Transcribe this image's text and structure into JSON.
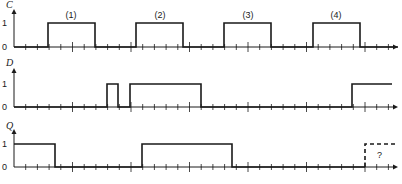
{
  "colors": {
    "ink": "#1a1a1a",
    "background": "#ffffff"
  },
  "axis": {
    "x_start": 14,
    "x_end": 398,
    "minor_tick_spacing": 11.7,
    "major_every": 5
  },
  "signals": [
    {
      "name": "C",
      "baseline_y": 47,
      "high_y": 23,
      "axis_top_y": 9,
      "label_y": 9,
      "level1_label": "1",
      "level0_label": "0",
      "edges": [
        [
          14,
          0
        ],
        [
          48,
          1
        ],
        [
          95,
          0
        ],
        [
          136,
          1
        ],
        [
          183,
          0
        ],
        [
          224,
          1
        ],
        [
          271,
          0
        ],
        [
          313,
          1
        ],
        [
          360,
          0
        ],
        [
          398,
          0
        ]
      ],
      "pulse_labels": [
        {
          "text": "(1)",
          "x": 71
        },
        {
          "text": "(2)",
          "x": 160
        },
        {
          "text": "(3)",
          "x": 248
        },
        {
          "text": "(4)",
          "x": 336
        }
      ]
    },
    {
      "name": "D",
      "baseline_y": 107,
      "high_y": 84,
      "axis_top_y": 68,
      "label_y": 67,
      "level1_label": "1",
      "level0_label": "0",
      "edges": [
        [
          14,
          0
        ],
        [
          107,
          1
        ],
        [
          118,
          0
        ],
        [
          130,
          1
        ],
        [
          201,
          0
        ],
        [
          352,
          1
        ],
        [
          392,
          1
        ]
      ],
      "pulse_labels": []
    },
    {
      "name": "Q",
      "baseline_y": 167,
      "high_y": 144,
      "axis_top_y": 129,
      "label_y": 130,
      "level1_label": "1",
      "level0_label": "0",
      "edges": [
        [
          14,
          1
        ],
        [
          55,
          0
        ],
        [
          142,
          1
        ],
        [
          232,
          0
        ],
        [
          365,
          0
        ]
      ],
      "dashed_segment": {
        "rise_x": 365,
        "end_x": 398
      },
      "unknown_label": "?",
      "pulse_labels": []
    }
  ]
}
